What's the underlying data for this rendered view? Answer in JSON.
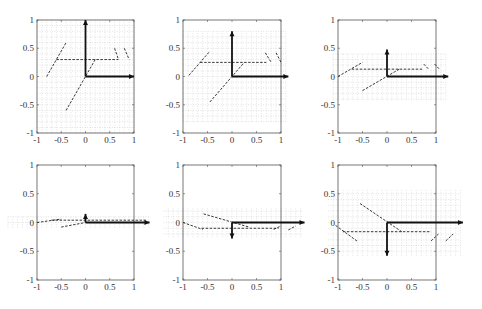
{
  "chart_data": [
    {
      "type": "line",
      "panel": 1,
      "title": "",
      "xlim": [
        -1,
        1
      ],
      "ylim": [
        -1,
        1
      ],
      "xticks": [
        "-1",
        "-0.5",
        "0",
        "0.5",
        "1"
      ],
      "yticks": [
        "1",
        "0.5",
        "0",
        "-0.5",
        "-1"
      ],
      "grid_band": {
        "x": [
          -1,
          1
        ],
        "y": [
          -1,
          1
        ]
      },
      "arrows": [
        {
          "from": [
            0,
            0
          ],
          "to": [
            0,
            1
          ]
        },
        {
          "from": [
            0,
            0
          ],
          "to": [
            1,
            0
          ]
        }
      ],
      "dashed_segments": [
        [
          [
            -0.6,
            0.3
          ],
          [
            0.68,
            0.3
          ]
        ],
        [
          [
            -0.8,
            0.0
          ],
          [
            -0.4,
            0.6
          ]
        ],
        [
          [
            -0.4,
            -0.6
          ],
          [
            0.2,
            0.3
          ]
        ],
        [
          [
            0.6,
            0.5
          ],
          [
            0.68,
            0.3
          ]
        ],
        [
          [
            0.8,
            0.5
          ],
          [
            0.9,
            0.3
          ]
        ]
      ]
    },
    {
      "type": "line",
      "panel": 2,
      "title": "",
      "xlim": [
        -1,
        1
      ],
      "ylim": [
        -1,
        1
      ],
      "xticks": [
        "-1",
        "-0.5",
        "0",
        "0.5",
        "1"
      ],
      "yticks": [
        "1",
        "0.5",
        "0",
        "-0.5",
        "-1"
      ],
      "grid_band": {
        "x": [
          -1,
          1.1
        ],
        "y": [
          -0.8,
          0.8
        ]
      },
      "arrows": [
        {
          "from": [
            0,
            0
          ],
          "to": [
            0,
            0.8
          ]
        },
        {
          "from": [
            0,
            0
          ],
          "to": [
            1.15,
            0
          ]
        }
      ],
      "dashed_segments": [
        [
          [
            -0.65,
            0.25
          ],
          [
            0.7,
            0.25
          ]
        ],
        [
          [
            -0.88,
            0.02
          ],
          [
            -0.45,
            0.45
          ]
        ],
        [
          [
            -0.45,
            -0.45
          ],
          [
            0.25,
            0.25
          ]
        ],
        [
          [
            0.68,
            0.42
          ],
          [
            0.8,
            0.25
          ]
        ],
        [
          [
            0.9,
            0.42
          ],
          [
            1.0,
            0.25
          ]
        ]
      ]
    },
    {
      "type": "line",
      "panel": 3,
      "title": "",
      "xlim": [
        -1,
        1
      ],
      "ylim": [
        -1,
        1
      ],
      "xticks": [
        "-1",
        "-0.5",
        "0",
        "0.5",
        "1"
      ],
      "yticks": [
        "1",
        "0.5",
        "0",
        "-0.5",
        "-1"
      ],
      "grid_band": {
        "x": [
          -1.1,
          1.2
        ],
        "y": [
          -0.42,
          0.42
        ]
      },
      "arrows": [
        {
          "from": [
            0,
            0
          ],
          "to": [
            0,
            0.48
          ]
        },
        {
          "from": [
            0,
            0
          ],
          "to": [
            1.25,
            0
          ]
        }
      ],
      "dashed_segments": [
        [
          [
            -0.72,
            0.13
          ],
          [
            0.75,
            0.13
          ]
        ],
        [
          [
            -1.0,
            0.0
          ],
          [
            -0.5,
            0.25
          ]
        ],
        [
          [
            -0.5,
            -0.25
          ],
          [
            0.25,
            0.13
          ]
        ],
        [
          [
            0.75,
            0.22
          ],
          [
            0.85,
            0.13
          ]
        ],
        [
          [
            0.97,
            0.22
          ],
          [
            1.07,
            0.13
          ]
        ]
      ]
    },
    {
      "type": "line",
      "panel": 4,
      "title": "",
      "xlim": [
        -1,
        1
      ],
      "ylim": [
        -1,
        1
      ],
      "xticks": [
        "-1",
        "-0.5",
        "0",
        "0.5",
        "1"
      ],
      "yticks": [
        "1",
        "0.5",
        "0",
        "-0.5",
        "-1"
      ],
      "grid_band": {
        "x": [
          -1.6,
          1.3
        ],
        "y": [
          -0.09,
          0.1
        ]
      },
      "arrows": [
        {
          "from": [
            0,
            0
          ],
          "to": [
            0,
            0.15
          ]
        },
        {
          "from": [
            0,
            0
          ],
          "to": [
            1.32,
            0
          ]
        }
      ],
      "dashed_segments": [
        [
          [
            -1.0,
            0.0
          ],
          [
            -0.5,
            0.06
          ]
        ],
        [
          [
            -0.5,
            -0.08
          ],
          [
            0.0,
            0.0
          ]
        ],
        [
          [
            -0.7,
            0.04
          ],
          [
            1.25,
            0.04
          ]
        ]
      ]
    },
    {
      "type": "line",
      "panel": 5,
      "title": "",
      "xlim": [
        -1,
        1
      ],
      "ylim": [
        -1,
        1
      ],
      "xticks": [
        "-1",
        "-0.5",
        "0",
        "0.5",
        "1"
      ],
      "yticks": [
        "1",
        "0.5",
        "0",
        "-0.5",
        "-1"
      ],
      "grid_band": {
        "x": [
          -1.4,
          1.45
        ],
        "y": [
          -0.25,
          0.25
        ]
      },
      "arrows": [
        {
          "from": [
            0,
            0
          ],
          "to": [
            0,
            -0.28
          ]
        },
        {
          "from": [
            0,
            0
          ],
          "to": [
            1.48,
            0
          ]
        }
      ],
      "dashed_segments": [
        [
          [
            -0.62,
            -0.1
          ],
          [
            0.95,
            -0.1
          ]
        ],
        [
          [
            -0.58,
            0.15
          ],
          [
            0.35,
            -0.08
          ]
        ],
        [
          [
            -1.0,
            0.0
          ],
          [
            -0.6,
            -0.12
          ]
        ],
        [
          [
            0.85,
            -0.12
          ],
          [
            1.0,
            -0.06
          ]
        ],
        [
          [
            1.15,
            -0.13
          ],
          [
            1.3,
            -0.06
          ]
        ]
      ]
    },
    {
      "type": "line",
      "panel": 6,
      "title": "",
      "xlim": [
        -1,
        1
      ],
      "ylim": [
        -1,
        1
      ],
      "xticks": [
        "-1",
        "-0.5",
        "0",
        "0.5",
        "1"
      ],
      "yticks": [
        "1",
        "0.5",
        "0",
        "-0.5",
        "-1"
      ],
      "grid_band": {
        "x": [
          -1.2,
          1.5
        ],
        "y": [
          -0.58,
          0.58
        ]
      },
      "arrows": [
        {
          "from": [
            0,
            0
          ],
          "to": [
            0,
            -0.58
          ]
        },
        {
          "from": [
            0,
            0
          ],
          "to": [
            1.55,
            0
          ]
        }
      ],
      "dashed_segments": [
        [
          [
            -0.9,
            -0.16
          ],
          [
            0.9,
            -0.16
          ]
        ],
        [
          [
            -0.55,
            0.33
          ],
          [
            0.3,
            -0.16
          ]
        ],
        [
          [
            -1.05,
            -0.05
          ],
          [
            -0.6,
            -0.33
          ]
        ],
        [
          [
            0.9,
            -0.32
          ],
          [
            1.05,
            -0.2
          ]
        ],
        [
          [
            1.2,
            -0.32
          ],
          [
            1.35,
            -0.2
          ]
        ]
      ]
    }
  ],
  "layout": {
    "panels": [
      {
        "x0": 37,
        "x1": 134,
        "y0": 20,
        "y1": 133
      },
      {
        "x0": 183,
        "x1": 281,
        "y0": 20,
        "y1": 133
      },
      {
        "x0": 338,
        "x1": 436,
        "y0": 20,
        "y1": 133
      },
      {
        "x0": 37,
        "x1": 134,
        "y0": 165,
        "y1": 280
      },
      {
        "x0": 183,
        "x1": 281,
        "y0": 165,
        "y1": 280
      },
      {
        "x0": 338,
        "x1": 436,
        "y0": 165,
        "y1": 280
      }
    ],
    "colors": {
      "frame": "#555555",
      "grid": "#c8c8c8",
      "arrow": "#111111",
      "dash": "#222222",
      "tick_text": "#333333"
    }
  }
}
